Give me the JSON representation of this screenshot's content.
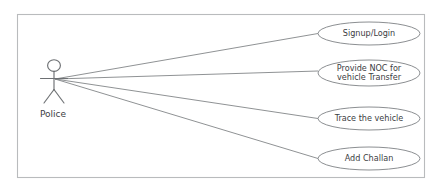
{
  "diagram": {
    "type": "uml-use-case-diagram",
    "system_boundary": {
      "label": "",
      "x": 17,
      "y": 14,
      "width": 407,
      "height": 163,
      "border_color": "#b9bbbd"
    },
    "actors": [
      {
        "id": "police",
        "label": "Police",
        "x": 54,
        "y": 83,
        "label_x": 53,
        "label_y": 117,
        "connector_origin_x": 55,
        "connector_origin_y": 79,
        "color": "#6d7073"
      }
    ],
    "use_cases": [
      {
        "id": "signup-login",
        "lines": [
          "Signup/Login"
        ],
        "cx": 369,
        "cy": 33.5,
        "rx": 51,
        "ry": 11.5,
        "fill": "#ffffff",
        "stroke": "#85888b"
      },
      {
        "id": "provide-noc-for-vehicle-transfer",
        "lines": [
          "Provide NOC for",
          "vehicle Transfer"
        ],
        "cx": 369,
        "cy": 73,
        "rx": 51,
        "ry": 13,
        "fill": "#ffffff",
        "stroke": "#85888b"
      },
      {
        "id": "trace-the-vehicle",
        "lines": [
          "Trace the vehicle"
        ],
        "cx": 369,
        "cy": 118.5,
        "rx": 51,
        "ry": 11.5,
        "fill": "#ffffff",
        "stroke": "#85888b"
      },
      {
        "id": "add-challan",
        "lines": [
          "Add Challan"
        ],
        "cx": 369,
        "cy": 158.5,
        "rx": 51,
        "ry": 11.5,
        "fill": "#ffffff",
        "stroke": "#85888b"
      }
    ],
    "associations": [
      {
        "id": "police-to-signup-login",
        "from": "police",
        "to": "signup-login",
        "x1": 55,
        "y1": 79,
        "x2": 318,
        "y2": 33.5
      },
      {
        "id": "police-to-provide-noc",
        "from": "police",
        "to": "provide-noc-for-vehicle-transfer",
        "x1": 55,
        "y1": 79,
        "x2": 318,
        "y2": 71
      },
      {
        "id": "police-to-trace-vehicle",
        "from": "police",
        "to": "trace-the-vehicle",
        "x1": 55,
        "y1": 79,
        "x2": 318,
        "y2": 118.5
      },
      {
        "id": "police-to-add-challan",
        "from": "police",
        "to": "add-challan",
        "x1": 55,
        "y1": 79,
        "x2": 318,
        "y2": 158.5
      }
    ]
  }
}
